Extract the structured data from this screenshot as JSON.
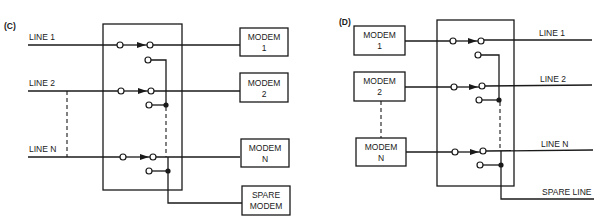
{
  "diagram_c": {
    "panel_label": "(C)",
    "lines": [
      {
        "label": "LINE 1"
      },
      {
        "label": "LINE 2"
      },
      {
        "label": "LINE N"
      }
    ],
    "modems": [
      {
        "line1": "MODEM",
        "line2": "1"
      },
      {
        "line1": "MODEM",
        "line2": "2"
      },
      {
        "line1": "MODEM",
        "line2": "N"
      },
      {
        "line1": "SPARE",
        "line2": "MODEM"
      }
    ]
  },
  "diagram_d": {
    "panel_label": "(D)",
    "modems": [
      {
        "line1": "MODEM",
        "line2": "1"
      },
      {
        "line1": "MODEM",
        "line2": "2"
      },
      {
        "line1": "MODEM",
        "line2": "N"
      }
    ],
    "lines": [
      {
        "label": "LINE 1"
      },
      {
        "label": "LINE 2"
      },
      {
        "label": "LINE N"
      },
      {
        "label": "SPARE LINE"
      }
    ]
  },
  "colors": {
    "stroke": "#1a1a1a",
    "background": "#ffffff"
  }
}
